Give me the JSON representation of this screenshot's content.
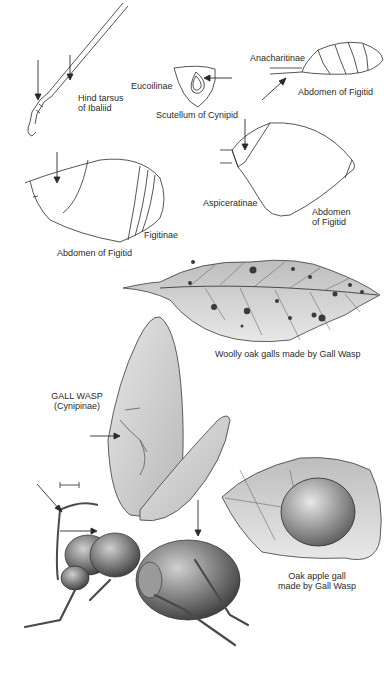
{
  "plate": {
    "labels": {
      "hind_tarsus": [
        "Hind tarsus",
        "of Ibaliid"
      ],
      "eucoilinae": "Eucoilinae",
      "scutellum": "Scutellum of Cynipid",
      "anacharitinae": "Anacharitinae",
      "abdomen_figitid_top": "Abdomen of Figitid",
      "aspiceratinae": "Aspiceratinae",
      "abdomen_figitid_right": [
        "Abdomen",
        "of Figitid"
      ],
      "figitinae": "Figitinae",
      "abdomen_figitid_left": "Abdomen of Figitid",
      "woolly_galls": "Woolly oak galls made by Gall Wasp",
      "gall_wasp_title": "GALL WASP",
      "gall_wasp_subtitle": "(Cynipinae)",
      "oak_apple": [
        "Oak apple gall",
        "made by Gall Wasp"
      ]
    },
    "colors": {
      "ink": "#2a2a2a",
      "shade_dark": "#4a4a4a",
      "shade_mid": "#9a9a9a",
      "shade_light": "#d8d8d8",
      "background": "#ffffff"
    }
  }
}
